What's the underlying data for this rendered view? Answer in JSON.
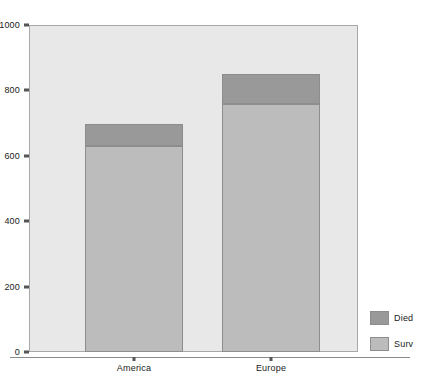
{
  "chart_data": {
    "type": "bar",
    "stacked": true,
    "title": "",
    "xlabel": "",
    "ylabel": "",
    "categories": [
      "America",
      "Europe"
    ],
    "series": [
      {
        "name": "Surv",
        "values": [
          630,
          758
        ],
        "color": "#bcbcbc"
      },
      {
        "name": "Died",
        "values": [
          68,
          92
        ],
        "color": "#999999"
      }
    ],
    "totals": [
      698,
      850
    ],
    "ylim": [
      0,
      1000
    ],
    "yticks": [
      0,
      200,
      400,
      600,
      800,
      1000
    ],
    "ytick_labels": [
      "0",
      "200",
      "400",
      "600",
      "800",
      "1000"
    ],
    "grid": false,
    "legend_position": "right-bottom",
    "legend_entries": [
      {
        "label": "Died",
        "color": "#999999"
      },
      {
        "label": "Surv",
        "color": "#bcbcbc"
      }
    ],
    "plot_background": "#e8e8e8",
    "figure_background": "#ffffff"
  }
}
